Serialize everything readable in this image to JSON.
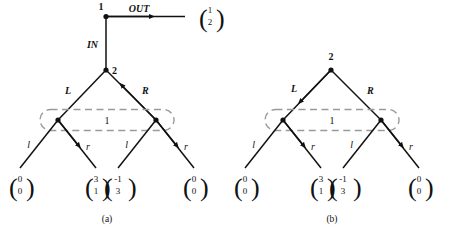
{
  "figure": {
    "caption_a": "(a)",
    "caption_b": "(b)",
    "colors": {
      "stroke": "#111111",
      "dashed_box": "#9a9a9a",
      "background": "#ffffff"
    }
  },
  "panel_a": {
    "label": "(a)",
    "nodes": {
      "root": "1",
      "inner": "2",
      "hyperedge_box": "1"
    },
    "edges": {
      "in": "IN",
      "out": "OUT",
      "left": "L",
      "right": "R",
      "leaf_left_1": "l",
      "leaf_right_1": "r",
      "leaf_left_2": "l",
      "leaf_right_2": "r"
    },
    "out_vector": {
      "top": "1",
      "bottom": "2"
    },
    "leaves": [
      {
        "top": "0",
        "bottom": "0"
      },
      {
        "top": "3",
        "bottom": "1"
      },
      {
        "top": "-1",
        "bottom": "3"
      },
      {
        "top": "0",
        "bottom": "0"
      }
    ]
  },
  "panel_b": {
    "label": "(b)",
    "nodes": {
      "inner": "2",
      "hyperedge_box": "1"
    },
    "edges": {
      "left": "L",
      "right": "R",
      "leaf_left_1": "l",
      "leaf_right_1": "r",
      "leaf_left_2": "l",
      "leaf_right_2": "r"
    },
    "leaves": [
      {
        "top": "0",
        "bottom": "0"
      },
      {
        "top": "3",
        "bottom": "1"
      },
      {
        "top": "-1",
        "bottom": "3"
      },
      {
        "top": "0",
        "bottom": "0"
      }
    ]
  }
}
